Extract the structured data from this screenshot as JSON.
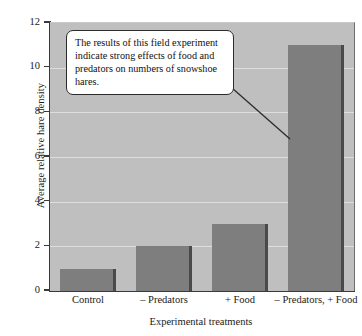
{
  "chart_data": {
    "type": "bar",
    "title": "",
    "xlabel": "Experimental treatments",
    "ylabel": "Average relative hare density",
    "categories": [
      "Control",
      "– Predators",
      "+ Food",
      "– Predators, + Food"
    ],
    "values": [
      1,
      2,
      3,
      11
    ],
    "ylim": [
      0,
      12
    ],
    "ytick_labels": [
      "0",
      "2",
      "4",
      "6",
      "8",
      "10",
      "12"
    ],
    "ytick_values": [
      0,
      2,
      4,
      6,
      8,
      10,
      12
    ],
    "grid": true,
    "legend": "none",
    "series": [
      {
        "name": "Average relative hare density",
        "values": [
          1,
          2,
          3,
          11
        ]
      }
    ],
    "annotations": [
      {
        "text": "The results of this field experiment indicate strong effects of food and predators on numbers of snowshoe hares.",
        "points_to_category": "– Predators, + Food"
      }
    ],
    "colors": {
      "bar_fill": "#7e7e7e",
      "bar_edge": "#4a4a4a",
      "plot_background": "#bfbfbf",
      "gridline": "#dedede",
      "axis": "#3a3a3a",
      "callout_background": "#ffffff",
      "callout_border": "#2b2b2b"
    }
  },
  "callout": {
    "text": "The results of this field experiment indicate strong effects of food and predators on numbers of snowshoe hares."
  }
}
